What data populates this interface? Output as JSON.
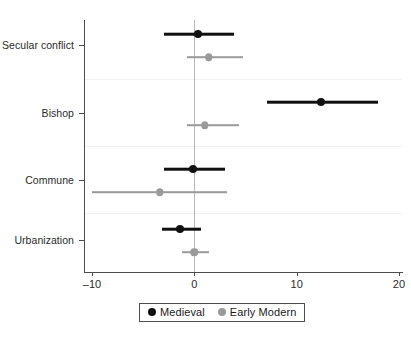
{
  "chart_data": {
    "type": "scatter",
    "subtype": "dot-and-whisker coefficient plot",
    "title": "",
    "subtitle": "",
    "xlabel": "",
    "ylabel": "",
    "categories": [
      "Secular conflict",
      "Bishop",
      "Commune",
      "Urbanization"
    ],
    "xlim": [
      -10,
      20
    ],
    "xticks": [
      -10,
      0,
      10,
      20
    ],
    "xtick_labels": [
      "–10",
      "0",
      "10",
      "20"
    ],
    "grid": false,
    "reference_line_x": 0,
    "legend_position": "bottom-center",
    "series": [
      {
        "name": "Medieval",
        "color": "#111111",
        "values": [
          0.4,
          12.4,
          -0.1,
          -1.4
        ],
        "ci_low": [
          -3.0,
          7.1,
          -3.0,
          -3.2
        ],
        "ci_high": [
          3.9,
          17.9,
          3.0,
          0.7
        ]
      },
      {
        "name": "Early Modern",
        "color": "#9a9a9a",
        "values": [
          1.4,
          1.0,
          -3.4,
          0.0
        ],
        "ci_low": [
          -0.7,
          -0.7,
          -10.0,
          -1.2
        ],
        "ci_high": [
          4.8,
          4.4,
          3.2,
          1.4
        ]
      }
    ]
  },
  "legend": {
    "entries": [
      {
        "label": "Medieval",
        "color": "#111111",
        "marker": "filled-circle-icon"
      },
      {
        "label": "Early Modern",
        "color": "#9a9a9a",
        "marker": "filled-circle-icon"
      }
    ]
  }
}
